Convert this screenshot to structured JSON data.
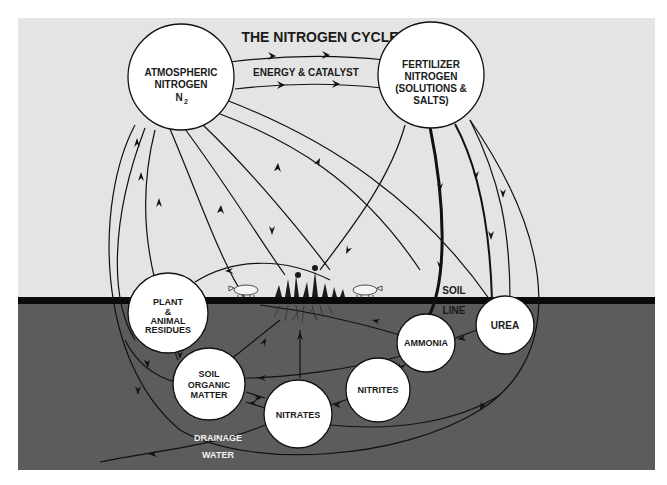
{
  "title": "THE NITROGEN CYCLE",
  "colors": {
    "sky": "#e4e4e4",
    "soil": "#5c5c5c",
    "soil_line": "#0a0a0a",
    "node_fill": "#ffffff",
    "ink": "#111111"
  },
  "nodes": {
    "atmospheric": {
      "line1": "ATMOSPHERIC",
      "line2": "NITROGEN",
      "line3": "N",
      "sub": "2"
    },
    "fertilizer": {
      "line1": "FERTILIZER",
      "line2": "NITROGEN",
      "line3": "(SOLUTIONS &",
      "line4": "SALTS)"
    },
    "residues": {
      "line1": "PLANT",
      "line2": "&",
      "line3": "ANIMAL",
      "line4": "RESIDUES"
    },
    "urea": {
      "label": "UREA"
    },
    "ammonia": {
      "label": "AMMONIA"
    },
    "organic": {
      "line1": "SOIL",
      "line2": "ORGANIC",
      "line3": "MATTER"
    },
    "nitrites": {
      "label": "NITRITES"
    },
    "nitrates": {
      "label": "NITRATES"
    }
  },
  "labels": {
    "energy": "ENERGY & CATALYST",
    "soil": "SOIL",
    "line": "LINE",
    "drainage": "DRAINAGE",
    "water": "WATER"
  }
}
